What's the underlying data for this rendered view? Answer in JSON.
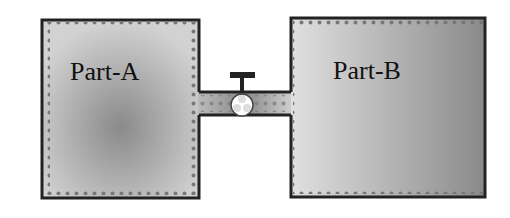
{
  "diagram": {
    "parts": [
      {
        "id": "part-a",
        "label": "Part-A"
      },
      {
        "id": "part-b",
        "label": "Part-B"
      }
    ],
    "connector": {
      "type": "pipe",
      "valve": "valve"
    }
  }
}
